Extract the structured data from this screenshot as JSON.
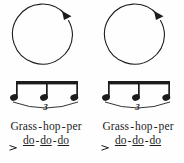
{
  "figure": {
    "background_color": "#fefefe",
    "ink_color": "#1c1c1c",
    "panel_count": 2
  },
  "panels": [
    {
      "id": "panel-left",
      "circle": {
        "direction": "clockwise",
        "arrowhead_position": "top-right"
      },
      "notation": {
        "note_count": 3,
        "note_type": "eighth",
        "beamed": true,
        "tuplet_number": "3",
        "slur": true
      },
      "lyrics": {
        "line1": [
          {
            "text": "Grass",
            "underlined": false
          },
          {
            "text": "hop",
            "underlined": false
          },
          {
            "text": "per",
            "underlined": false
          }
        ],
        "line2": [
          {
            "text": "do",
            "underlined": true
          },
          {
            "text": "do",
            "underlined": true
          },
          {
            "text": "do",
            "underlined": true
          }
        ],
        "separator": "-",
        "accent": ">"
      }
    },
    {
      "id": "panel-right",
      "circle": {
        "direction": "clockwise",
        "arrowhead_position": "top-right"
      },
      "notation": {
        "note_count": 3,
        "note_type": "eighth",
        "beamed": true,
        "tuplet_number": "3",
        "slur": true
      },
      "lyrics": {
        "line1": [
          {
            "text": "Grass",
            "underlined": false
          },
          {
            "text": "hop",
            "underlined": false
          },
          {
            "text": "per",
            "underlined": false
          }
        ],
        "line2": [
          {
            "text": "do",
            "underlined": true
          },
          {
            "text": "do",
            "underlined": true
          },
          {
            "text": "do",
            "underlined": true
          }
        ],
        "separator": "-",
        "accent": ">"
      }
    }
  ]
}
